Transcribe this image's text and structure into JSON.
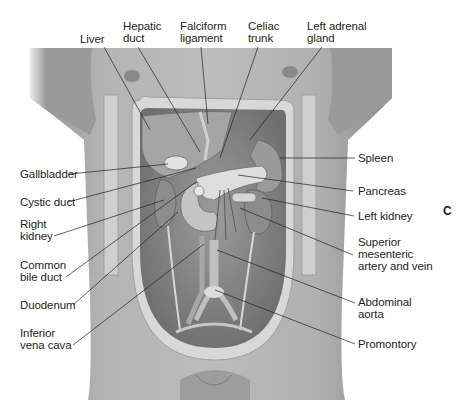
{
  "figure": {
    "panel_letter": "C",
    "colors": {
      "background": "#ffffff",
      "skin": "#a9a9a9",
      "cavity_rim": "#d6d6d6",
      "line": "#231f20"
    }
  },
  "labels": {
    "top": [
      {
        "id": "liver",
        "lines": [
          "Liver"
        ]
      },
      {
        "id": "hepatic-duct",
        "lines": [
          "Hepatic",
          "duct"
        ]
      },
      {
        "id": "falciform-ligament",
        "lines": [
          "Falciform",
          "ligament"
        ]
      },
      {
        "id": "celiac-trunk",
        "lines": [
          "Celiac",
          "trunk"
        ]
      },
      {
        "id": "left-adrenal-gland",
        "lines": [
          "Left adrenal",
          "gland"
        ]
      }
    ],
    "left": [
      {
        "id": "gallbladder",
        "lines": [
          "Gallbladder"
        ]
      },
      {
        "id": "cystic-duct",
        "lines": [
          "Cystic duct"
        ]
      },
      {
        "id": "right-kidney",
        "lines": [
          "Right",
          "kidney"
        ]
      },
      {
        "id": "common-bile-duct",
        "lines": [
          "Common",
          "bile duct"
        ]
      },
      {
        "id": "duodenum",
        "lines": [
          "Duodenum"
        ]
      },
      {
        "id": "inferior-vena-cava",
        "lines": [
          "Inferior",
          "vena cava"
        ]
      }
    ],
    "right": [
      {
        "id": "spleen",
        "lines": [
          "Spleen"
        ]
      },
      {
        "id": "pancreas",
        "lines": [
          "Pancreas"
        ]
      },
      {
        "id": "left-kidney",
        "lines": [
          "Left kidney"
        ]
      },
      {
        "id": "superior-mesenteric",
        "lines": [
          "Superior",
          "mesenteric",
          "artery and vein"
        ]
      },
      {
        "id": "abdominal-aorta",
        "lines": [
          "Abdominal",
          "aorta"
        ]
      },
      {
        "id": "promontory",
        "lines": [
          "Promontory"
        ]
      }
    ]
  }
}
